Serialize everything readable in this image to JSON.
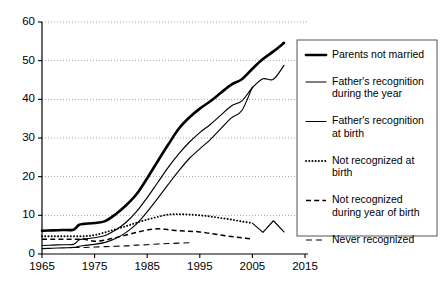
{
  "chart_data": {
    "type": "line",
    "title": "",
    "subtitle": "",
    "xlabel": "",
    "ylabel": "",
    "xlim": [
      1965,
      2015
    ],
    "ylim": [
      0,
      60
    ],
    "xticks": [
      1965,
      1975,
      1985,
      1995,
      2005,
      2015
    ],
    "yticks": [
      0,
      10,
      20,
      30,
      40,
      50,
      60
    ],
    "xtick_labels": [
      "1965",
      "1975",
      "1985",
      "1995",
      "2005",
      "2015"
    ],
    "ytick_labels": [
      "0",
      "10",
      "20",
      "30",
      "40",
      "50",
      "60"
    ],
    "grid": "horizontal-dotted",
    "legend_position": "right",
    "series": [
      {
        "name": "Parents not married",
        "style": "thick-solid",
        "x": [
          1965,
          1967,
          1969,
          1971,
          1972,
          1973,
          1975,
          1977,
          1979,
          1981,
          1983,
          1985,
          1987,
          1989,
          1991,
          1993,
          1995,
          1997,
          1999,
          2001,
          2003,
          2005,
          2007,
          2009,
          2011
        ],
        "values": [
          6.0,
          6.1,
          6.2,
          6.3,
          7.5,
          7.8,
          8.0,
          8.5,
          10.3,
          12.6,
          15.5,
          19.6,
          24.0,
          28.3,
          32.4,
          35.3,
          37.6,
          39.5,
          41.7,
          43.8,
          45.2,
          47.9,
          50.4,
          52.4,
          54.6
        ]
      },
      {
        "name": "Father's recognition during the year",
        "style": "thin-solid",
        "x": [
          1965,
          1967,
          1969,
          1971,
          1972,
          1973,
          1975,
          1977,
          1979,
          1981,
          1983,
          1985,
          1987,
          1989,
          1991,
          1993,
          1995,
          1997,
          1999,
          2001,
          2003,
          2005,
          2007,
          2009,
          2011
        ],
        "values": [
          2.2,
          2.3,
          2.4,
          2.5,
          3.6,
          3.9,
          4.2,
          4.8,
          6.2,
          8.2,
          11.0,
          14.6,
          18.5,
          22.4,
          25.9,
          28.9,
          31.4,
          33.5,
          35.9,
          38.3,
          39.6,
          43.0,
          45.3,
          45.2,
          48.8
        ]
      },
      {
        "name": "Father's recognition at birth",
        "style": "thin-solid",
        "x": [
          1965,
          1967,
          1969,
          1971,
          1972,
          1973,
          1975,
          1977,
          1979,
          1981,
          1983,
          1985,
          1987,
          1989,
          1991,
          1993,
          1995,
          1997,
          1999,
          2001,
          2003,
          2005
        ],
        "values": [
          1.4,
          1.5,
          1.6,
          1.7,
          2.0,
          2.2,
          2.5,
          3.0,
          4.0,
          5.6,
          7.8,
          10.9,
          14.4,
          18.0,
          21.5,
          24.7,
          27.2,
          29.6,
          32.4,
          35.2,
          37.1,
          43.2
        ]
      },
      {
        "name": "Not recognized at birth",
        "style": "dotted",
        "x": [
          1965,
          1967,
          1969,
          1971,
          1973,
          1975,
          1977,
          1979,
          1981,
          1983,
          1985,
          1987,
          1989,
          1991,
          1993,
          1995,
          1997,
          1999,
          2001,
          2003,
          2005
        ],
        "values": [
          4.6,
          4.6,
          4.6,
          4.6,
          4.6,
          4.9,
          5.6,
          6.4,
          7.2,
          8.1,
          8.9,
          9.6,
          10.2,
          10.3,
          10.2,
          10.0,
          9.7,
          9.3,
          8.9,
          8.4,
          8.0
        ]
      },
      {
        "name": "Not recognized during year of birth",
        "style": "dashed",
        "x": [
          1965,
          1967,
          1969,
          1971,
          1973,
          1975,
          1977,
          1979,
          1981,
          1983,
          1985,
          1987,
          1989,
          1991,
          1993,
          1995,
          1997,
          1999,
          2001,
          2003,
          2005
        ],
        "values": [
          3.8,
          3.8,
          3.8,
          3.8,
          3.8,
          3.3,
          3.6,
          4.2,
          4.9,
          5.6,
          6.2,
          6.5,
          6.3,
          6.0,
          5.9,
          5.7,
          5.3,
          4.9,
          4.5,
          4.2,
          3.9
        ]
      },
      {
        "name": "Never recognized",
        "style": "long-dashed",
        "x": [
          1971,
          1973,
          1975,
          1977,
          1979,
          1981,
          1983,
          1985,
          1987,
          1989,
          1991,
          1993
        ],
        "values": [
          1.7,
          1.7,
          1.8,
          1.9,
          2.0,
          2.1,
          2.3,
          2.4,
          2.6,
          2.7,
          2.8,
          2.9
        ]
      },
      {
        "name": "Not recognized at birth (late segment)",
        "style": "thin-solid",
        "x": [
          2005,
          2007,
          2009,
          2011
        ],
        "values": [
          8.0,
          5.6,
          8.6,
          5.7
        ]
      }
    ]
  },
  "legend": {
    "items": [
      {
        "label_lines": [
          "Parents not married"
        ],
        "style": "thick-solid"
      },
      {
        "label_lines": [
          "Father's recognition",
          "during the year"
        ],
        "style": "thin-solid"
      },
      {
        "label_lines": [
          "Father's recognition",
          "at birth"
        ],
        "style": "thin-solid"
      },
      {
        "label_lines": [
          "Not recognized at",
          "birth"
        ],
        "style": "dotted"
      },
      {
        "label_lines": [
          "Not recognized",
          "during year of birth"
        ],
        "style": "dashed"
      },
      {
        "label_lines": [
          "Never recognized"
        ],
        "style": "long-dashed"
      }
    ]
  }
}
